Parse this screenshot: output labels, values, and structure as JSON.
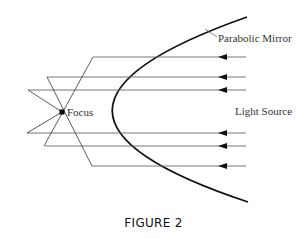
{
  "figure": {
    "caption": "FIGURE 2",
    "labels": {
      "mirror": "Parabolic Mirror",
      "focus": "Focus",
      "source": "Light Source"
    },
    "colors": {
      "mirror": "#111111",
      "rays": "#555555",
      "arrowheads": "#111111",
      "focus_dot": "#000000"
    },
    "geometry": {
      "vertex": [
        16,
        112
      ],
      "focus": [
        62,
        112
      ],
      "mirror_top_end": [
        247,
        17
      ],
      "mirror_bottom_end": [
        248,
        202
      ],
      "ray_source_x": 246,
      "rays": [
        {
          "y": 57,
          "hit_x": 93
        },
        {
          "y": 77,
          "hit_x": 47
        },
        {
          "y": 90,
          "hit_x": 28
        },
        {
          "y": 133,
          "hit_x": 27
        },
        {
          "y": 146,
          "hit_x": 45
        },
        {
          "y": 166,
          "hit_x": 92
        }
      ]
    }
  }
}
